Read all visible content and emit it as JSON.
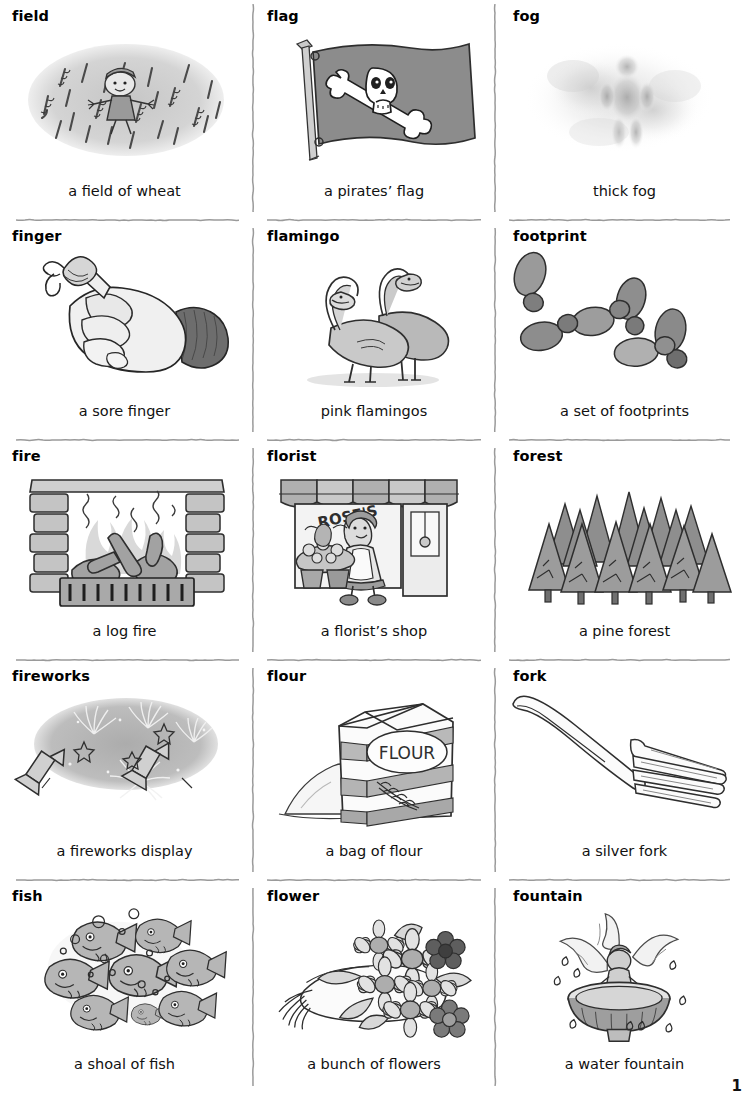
{
  "page": {
    "page_number": "1",
    "columns": 3,
    "rows": 5
  },
  "entries": [
    {
      "headword": "field",
      "caption": "a field of wheat",
      "illustration": "field-of-wheat-with-scarecrow"
    },
    {
      "headword": "flag",
      "caption": "a pirates’ flag",
      "illustration": "pirate-flag-skull-and-crossbones"
    },
    {
      "headword": "fog",
      "caption": "thick fog",
      "illustration": "figure-in-thick-fog"
    },
    {
      "headword": "finger",
      "caption": "a sore finger",
      "illustration": "bandaged-finger-on-fist"
    },
    {
      "headword": "flamingo",
      "caption": "pink flamingos",
      "illustration": "two-flamingos"
    },
    {
      "headword": "footprint",
      "caption": "a set of footprints",
      "illustration": "six-shoe-footprints"
    },
    {
      "headword": "fire",
      "caption": "a log fire",
      "illustration": "log-fire-in-brick-fireplace"
    },
    {
      "headword": "florist",
      "caption": "a florist’s shop",
      "illustration": "florist-shop-with-awning",
      "sign_text": "ROSE'S"
    },
    {
      "headword": "forest",
      "caption": "a pine forest",
      "illustration": "pine-tree-forest"
    },
    {
      "headword": "fireworks",
      "caption": "a fireworks display",
      "illustration": "fireworks-display-in-night-sky"
    },
    {
      "headword": "flour",
      "caption": "a bag of flour",
      "illustration": "flour-bag-with-spilled-pile",
      "label_text": "FLOUR"
    },
    {
      "headword": "fork",
      "caption": "a silver fork",
      "illustration": "silver-dinner-fork"
    },
    {
      "headword": "fish",
      "caption": "a shoal of fish",
      "illustration": "shoal-of-fish-with-bubbles"
    },
    {
      "headword": "flower",
      "caption": "a bunch of flowers",
      "illustration": "bunch-of-daisy-flowers"
    },
    {
      "headword": "fountain",
      "caption": "a water fountain",
      "illustration": "water-fountain-with-cherub"
    }
  ],
  "colors": {
    "ink": "#2b2b2b",
    "rule": "#9a9a9a",
    "mid_gray": "#9d9d9d",
    "light_gray": "#d2d2d2",
    "dark_gray": "#6a6a6a",
    "page_background": "#ffffff"
  }
}
